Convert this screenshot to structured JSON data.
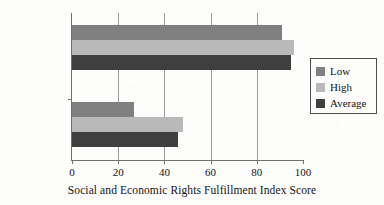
{
  "chart_data": {
    "type": "bar",
    "orientation": "horizontal",
    "title": "",
    "xlabel": "Social and Economic Rights Fulfillment Index Score",
    "ylabel": "",
    "categories": [
      "Top 10%",
      "Bottom 10%"
    ],
    "series": [
      {
        "name": "Low",
        "color": "#808080",
        "values": [
          91,
          27
        ]
      },
      {
        "name": "High",
        "color": "#b9b9b9",
        "values": [
          96,
          48
        ]
      },
      {
        "name": "Average",
        "color": "#3f3f3f",
        "values": [
          95,
          46
        ]
      }
    ],
    "xlim": [
      0,
      100
    ],
    "xticks": [
      0,
      20,
      40,
      60,
      80,
      100
    ],
    "xtick_labels": [
      "0",
      "20",
      "40",
      "60",
      "80",
      "100"
    ],
    "grid": true,
    "grid_axis": "x",
    "legend_position": "right"
  },
  "legend": {
    "entries": [
      {
        "label": "Low",
        "color": "#808080"
      },
      {
        "label": "High",
        "color": "#b9b9b9"
      },
      {
        "label": "Average",
        "color": "#3f3f3f"
      }
    ]
  }
}
